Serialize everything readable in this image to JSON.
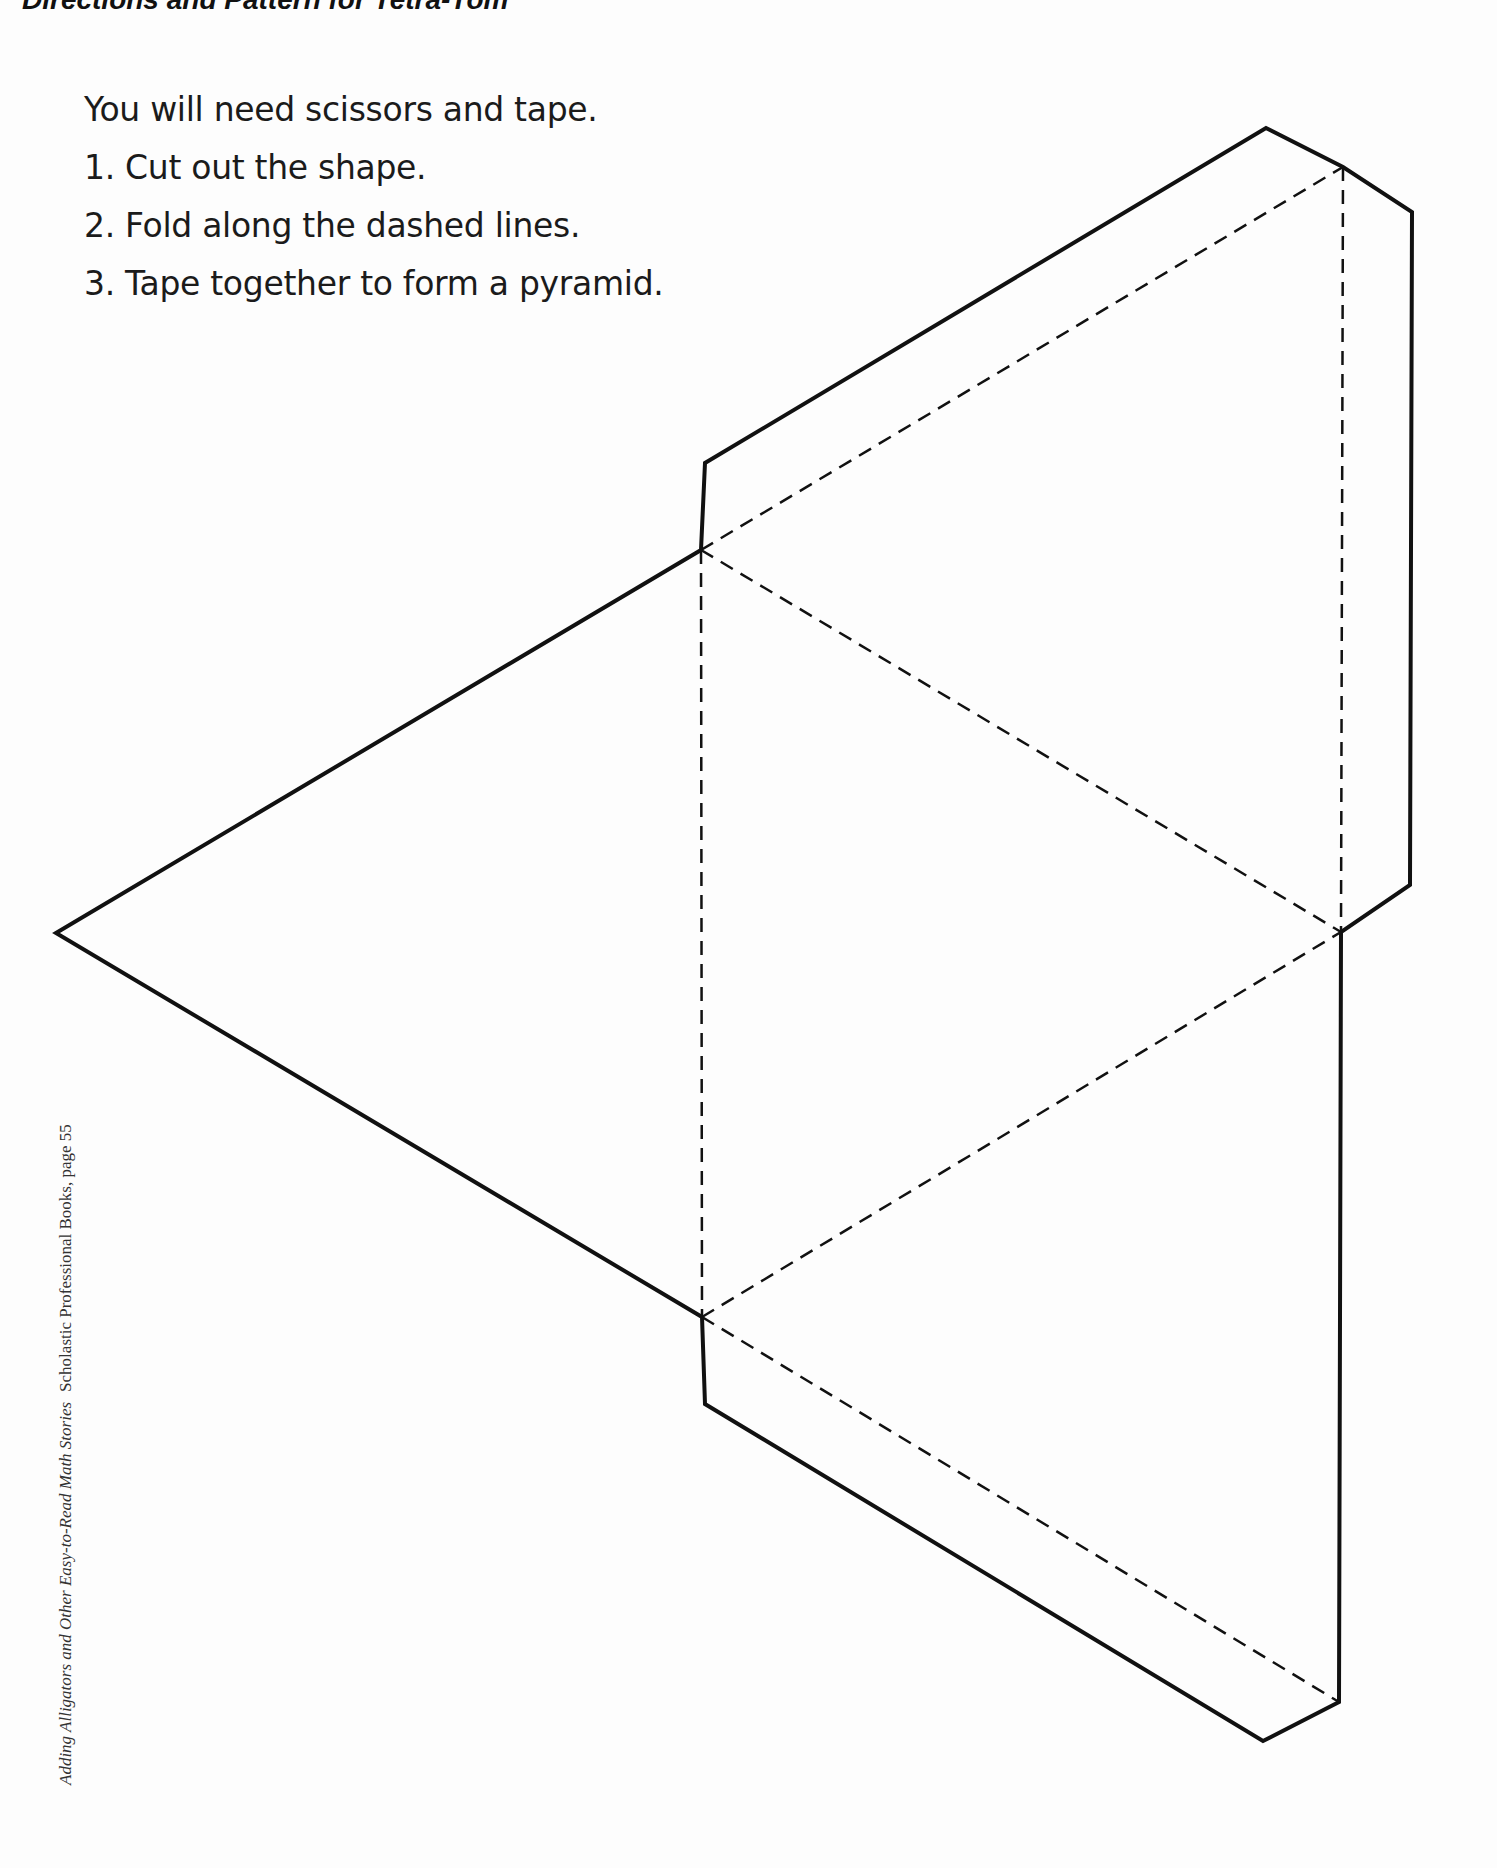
{
  "header": {
    "title": "Directions and Pattern for Tetra-Tom"
  },
  "instructions": {
    "intro": "You will need scissors and tape.",
    "steps": [
      "1. Cut out the shape.",
      "2. Fold along the dashed lines.",
      "3. Tape together to form a pyramid."
    ]
  },
  "credit": {
    "book_title": "Adding Alligators and Other Easy-to-Read Math Stories",
    "publisher": "Scholastic Professional Books, page 55"
  },
  "pattern": {
    "shape": "tetrahedron-net",
    "line_color": "#111111",
    "cut_line": "solid",
    "fold_line": "dashed"
  }
}
